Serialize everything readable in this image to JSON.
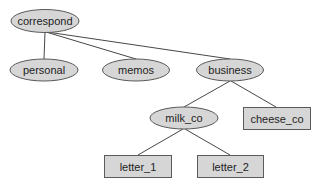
{
  "diagram": {
    "type": "directory-tree",
    "colors": {
      "node_fill": "#d6d6d6",
      "node_stroke": "#5a5a5a",
      "edge": "#474747",
      "text": "#222222"
    },
    "nodes": [
      {
        "id": "correspond",
        "label": "correspond",
        "kind": "directory",
        "shape": "ellipse"
      },
      {
        "id": "personal",
        "label": "personal",
        "kind": "directory",
        "shape": "ellipse"
      },
      {
        "id": "memos",
        "label": "memos",
        "kind": "directory",
        "shape": "ellipse"
      },
      {
        "id": "business",
        "label": "business",
        "kind": "directory",
        "shape": "ellipse"
      },
      {
        "id": "milk_co",
        "label": "milk_co",
        "kind": "directory",
        "shape": "ellipse"
      },
      {
        "id": "cheese_co",
        "label": "cheese_co",
        "kind": "file",
        "shape": "rectangle"
      },
      {
        "id": "letter_1",
        "label": "letter_1",
        "kind": "file",
        "shape": "rectangle"
      },
      {
        "id": "letter_2",
        "label": "letter_2",
        "kind": "file",
        "shape": "rectangle"
      }
    ],
    "edges": [
      {
        "from": "correspond",
        "to": "personal"
      },
      {
        "from": "correspond",
        "to": "memos"
      },
      {
        "from": "correspond",
        "to": "business"
      },
      {
        "from": "business",
        "to": "milk_co"
      },
      {
        "from": "business",
        "to": "cheese_co"
      },
      {
        "from": "milk_co",
        "to": "letter_1"
      },
      {
        "from": "milk_co",
        "to": "letter_2"
      }
    ]
  }
}
